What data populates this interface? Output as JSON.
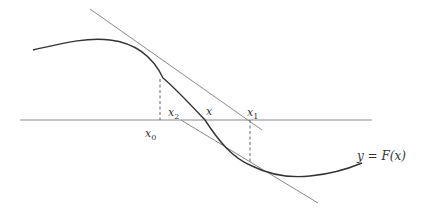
{
  "diagram": {
    "labels": {
      "x0": {
        "base": "x",
        "sub": "0"
      },
      "x2": {
        "base": "x",
        "sub": "2"
      },
      "x": {
        "base": "x",
        "sub": ""
      },
      "x1": {
        "base": "x",
        "sub": "1"
      },
      "curve": "y = F(x)"
    },
    "colors": {
      "curve": "#333333",
      "tangent": "#8a8a8a",
      "axis": "#8a8a8a",
      "dashed": "#555555"
    }
  }
}
